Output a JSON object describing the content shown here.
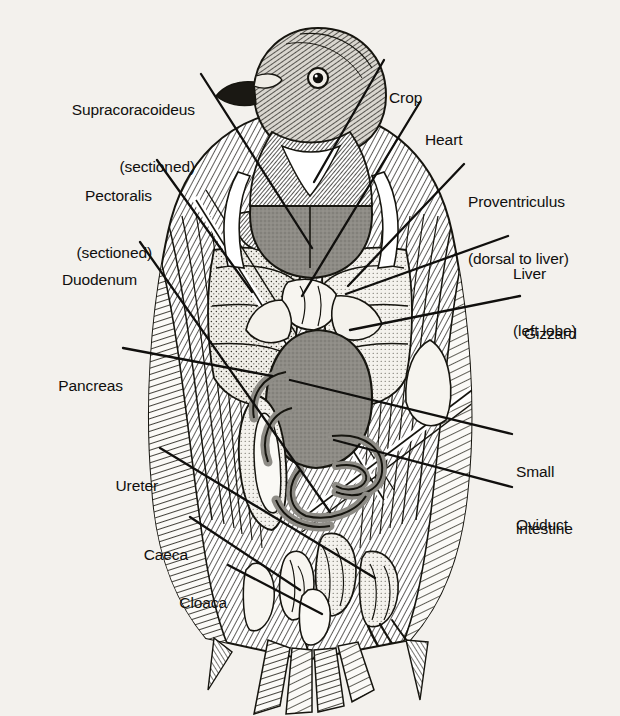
{
  "figure": {
    "caption": "",
    "background_color": "#f3f1ed",
    "ink_color": "#141310",
    "organ_fill": "#8e8c86",
    "organ_light_fill": "#e8e6e0"
  },
  "labels": {
    "supracoracoideus": {
      "line1": "Supracoracoideus",
      "line2": "(sectioned)"
    },
    "pectoralis": {
      "line1": "Pectoralis",
      "line2": "(sectioned)"
    },
    "duodenum": {
      "line1": "Duodenum"
    },
    "pancreas": {
      "line1": "Pancreas"
    },
    "ureter": {
      "line1": "Ureter"
    },
    "caeca": {
      "line1": "Caeca"
    },
    "cloaca": {
      "line1": "Cloaca"
    },
    "crop": {
      "line1": "Crop"
    },
    "heart": {
      "line1": "Heart"
    },
    "proventriculus": {
      "line1": "Proventriculus",
      "line2": "(dorsal to liver)"
    },
    "liver": {
      "line1": "Liver",
      "line2": "(left lobe)"
    },
    "gizzard": {
      "line1": "Gizzard"
    },
    "small_intestine": {
      "line1": "Small",
      "line2": "intestine"
    },
    "oviduct": {
      "line1": "Oviduct"
    }
  },
  "bleed_through": {
    "lines": [
      "system. This shows the stout sternum and",
      "spine bone supporting a deep keel structure",
      "and the wing muscles attach to a strong bone",
      "there are bird tendons passed into a process to",
      "and supports the bone structure carried",
      "that are strengthened by fine strong",
      "the muscles are broad and muscled",
      "and these tendons are strengthened by",
      "to the tips so that the force is carried",
      "skeleton of the pigeon is very light, but",
      "is sufficiently strong to resist strain.",
      "skull. A bird's skull bones are fused",
      "of it to make a shell that is wider than the",
      "and the bones are joined along predicted",
      "sutures which are fused across the skull",
      "Y shape. In a section of bone the",
      "pigeon's head resembles a beak as a bird",
      "is in the X-ray. A projection like a thin piece",
      "of a series of bones that house the lower jaw",
      "of the lower jaw and the upper jaw",
      "diblet found in the bony wings that probably was",
      "a jaw structure. The upper mandible called the",
      "is a beak is fused to the skull at sutures that are flexible"
    ]
  }
}
